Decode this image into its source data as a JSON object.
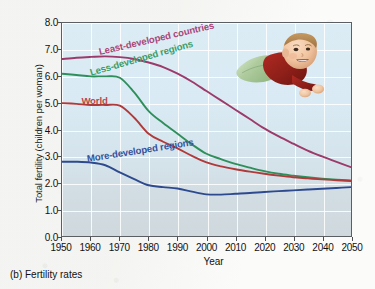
{
  "caption": "(b) Fertility rates",
  "chart_data": {
    "type": "line",
    "title": "",
    "xlabel": "Year",
    "ylabel": "Total fertility (children per woman)",
    "xlim": [
      1950,
      2050
    ],
    "ylim": [
      0,
      8
    ],
    "grid": true,
    "legend_position": "inline-on-curves",
    "xticks": [
      1950,
      1960,
      1970,
      1980,
      1990,
      2000,
      2010,
      2020,
      2030,
      2040,
      2050
    ],
    "yticks": [
      "0.0",
      "1.0",
      "2.0",
      "3.0",
      "4.0",
      "5.0",
      "6.0",
      "7.0",
      "8.0"
    ],
    "x": [
      1950,
      1955,
      1960,
      1965,
      1970,
      1975,
      1980,
      1985,
      1990,
      1995,
      2000,
      2005,
      2010,
      2015,
      2020,
      2025,
      2030,
      2035,
      2040,
      2045,
      2050
    ],
    "series": [
      {
        "name": "Least-developed countries",
        "color": "#9c3a6b",
        "label_color": "#a8487a",
        "values": [
          6.65,
          6.7,
          6.73,
          6.75,
          6.72,
          6.65,
          6.52,
          6.35,
          6.1,
          5.8,
          5.45,
          5.1,
          4.75,
          4.4,
          4.05,
          3.75,
          3.48,
          3.22,
          3.0,
          2.8,
          2.6
        ]
      },
      {
        "name": "Less-developed regions",
        "color": "#2f8f5b",
        "label_color": "#3a9e68",
        "values": [
          6.1,
          6.05,
          6.0,
          6.0,
          5.95,
          5.4,
          4.7,
          4.25,
          3.85,
          3.45,
          3.1,
          2.9,
          2.72,
          2.58,
          2.45,
          2.35,
          2.28,
          2.22,
          2.17,
          2.13,
          2.1
        ]
      },
      {
        "name": "World",
        "color": "#b03a3a",
        "label_color": "#c04545",
        "values": [
          5.0,
          4.97,
          4.93,
          4.93,
          4.9,
          4.45,
          3.85,
          3.55,
          3.3,
          3.02,
          2.78,
          2.63,
          2.52,
          2.43,
          2.35,
          2.28,
          2.22,
          2.18,
          2.14,
          2.11,
          2.08
        ]
      },
      {
        "name": "More-developed regions",
        "color": "#2d4a8f",
        "label_color": "#35529b",
        "values": [
          2.8,
          2.8,
          2.77,
          2.67,
          2.4,
          2.15,
          1.92,
          1.85,
          1.8,
          1.68,
          1.58,
          1.57,
          1.6,
          1.63,
          1.67,
          1.7,
          1.73,
          1.76,
          1.79,
          1.82,
          1.85
        ]
      }
    ]
  },
  "photo": {
    "name": "baby-photo",
    "alt": "Baby lying on stomach in red shirt and green pants"
  }
}
